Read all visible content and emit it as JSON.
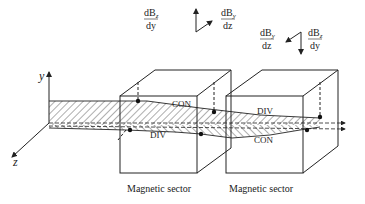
{
  "diagram": {
    "axes": {
      "y_label": "y",
      "z_label": "z"
    },
    "field_gradients": {
      "sector1": {
        "left_num": "dB",
        "left_num_sub": "z",
        "left_den": "dy",
        "right_num": "dB",
        "right_num_sub": "y",
        "right_den": "dz"
      },
      "sector2": {
        "left_num": "dB",
        "left_num_sub": "y",
        "left_den": "dz",
        "right_num": "dB",
        "right_num_sub": "z",
        "right_den": "dy"
      }
    },
    "beam_labels": {
      "sector1_upper": "CON",
      "sector1_lower": "DIV",
      "sector2_upper": "DIV",
      "sector2_lower": "CON"
    },
    "sectors": [
      {
        "caption": "Magnetic sector"
      },
      {
        "caption": "Magnetic sector"
      }
    ],
    "colors": {
      "line": "#222222",
      "background": "#ffffff"
    }
  }
}
